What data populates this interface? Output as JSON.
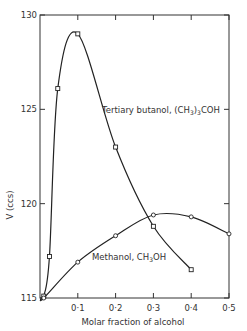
{
  "chart_data": {
    "type": "line",
    "title": "",
    "xlabel": "Molar fraction of alcohol",
    "ylabel": "V (ccs)",
    "xlim": [
      0,
      0.5
    ],
    "ylim": [
      115,
      130
    ],
    "x_ticks": [
      "0·1",
      "0·2",
      "0·3",
      "0·4",
      "0·5"
    ],
    "y_ticks": [
      "115",
      "120",
      "125",
      "130"
    ],
    "grid": false,
    "series": [
      {
        "name": "Tertiary butanol, (CH3)3COH",
        "label": "Tertiary butanol, (CH₃)₃COH",
        "marker": "square",
        "x": [
          0.01,
          0.025,
          0.047,
          0.1,
          0.2,
          0.3,
          0.4
        ],
        "values": [
          115.1,
          117.2,
          126.1,
          129.0,
          123.0,
          118.8,
          116.5
        ]
      },
      {
        "name": "Methanol, CH3OH",
        "label": "Methanol, CH₃OH",
        "marker": "circle",
        "x": [
          0.01,
          0.1,
          0.2,
          0.3,
          0.4,
          0.5
        ],
        "values": [
          115.0,
          116.9,
          118.3,
          119.4,
          119.3,
          118.4
        ]
      }
    ]
  }
}
